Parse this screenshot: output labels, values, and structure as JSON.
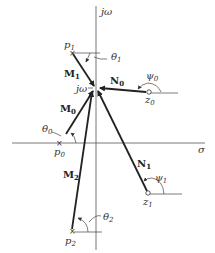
{
  "diagram": {
    "type": "s-plane pole-zero vector diagram",
    "axes": {
      "vertical_label": "jω",
      "horizontal_label": "σ"
    },
    "evaluation_point": {
      "label": "jω"
    },
    "poles": [
      {
        "id": "p0",
        "label": "p",
        "sub": "0",
        "angle_label": "θ",
        "angle_sub": "0",
        "vector_label": "M",
        "vector_sub": "0"
      },
      {
        "id": "p1",
        "label": "p",
        "sub": "1",
        "angle_label": "θ",
        "angle_sub": "1",
        "vector_label": "M",
        "vector_sub": "1"
      },
      {
        "id": "p2",
        "label": "p",
        "sub": "2",
        "angle_label": "θ",
        "angle_sub": "2",
        "vector_label": "M",
        "vector_sub": "2"
      }
    ],
    "zeros": [
      {
        "id": "z0",
        "label": "z",
        "sub": "0",
        "angle_label": "ψ",
        "angle_sub": "0",
        "vector_label": "N",
        "vector_sub": "0"
      },
      {
        "id": "z1",
        "label": "z",
        "sub": "1",
        "angle_label": "ψ",
        "angle_sub": "1",
        "vector_label": "N",
        "vector_sub": "1"
      }
    ]
  }
}
